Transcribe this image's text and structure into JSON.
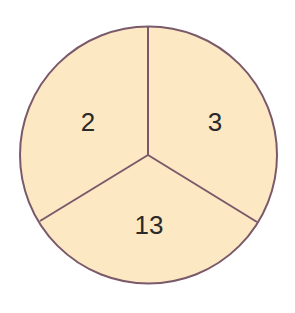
{
  "diagram": {
    "type": "divided-circle",
    "fill_color": "#fde8c4",
    "stroke_color": "#7a5a6a",
    "sections": [
      {
        "position": "top-left",
        "label": "2"
      },
      {
        "position": "top-right",
        "label": "3"
      },
      {
        "position": "bottom",
        "label": "13"
      }
    ]
  }
}
